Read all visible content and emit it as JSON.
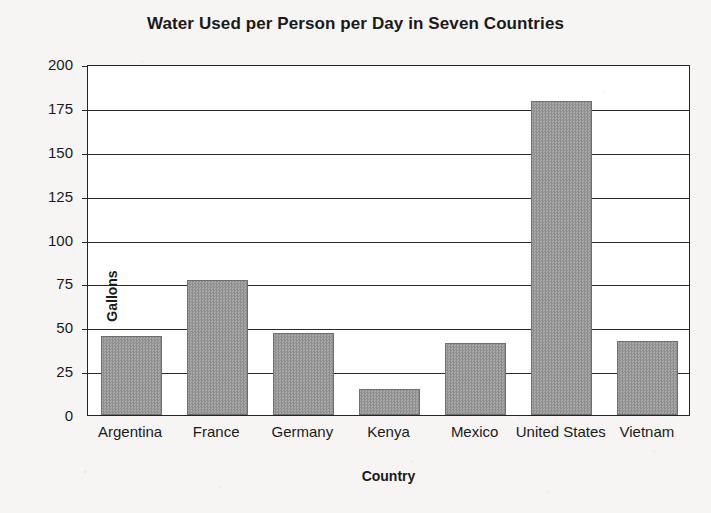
{
  "chart_data": {
    "type": "bar",
    "title": "Water Used per Person per Day in Seven Countries",
    "xlabel": "Country",
    "ylabel": "Gallons",
    "categories": [
      "Argentina",
      "France",
      "Germany",
      "Kenya",
      "Mexico",
      "United States",
      "Vietnam"
    ],
    "values": [
      45,
      77,
      47,
      15,
      41,
      179,
      42
    ],
    "ylim": [
      0,
      200
    ],
    "yticks": [
      0,
      25,
      50,
      75,
      100,
      125,
      150,
      175,
      200
    ],
    "ytick_labels": [
      "0",
      "25",
      "50",
      "75",
      "100",
      "125",
      "150",
      "175",
      "200"
    ],
    "grid": true,
    "grid_axis": "y",
    "legend": false,
    "bar_color": "#9a9a9a",
    "bar_edge_color": "#6f6f6f",
    "axis_color": "#242424",
    "plot_background": "#ffffff",
    "page_background": "#f6f5f3"
  }
}
